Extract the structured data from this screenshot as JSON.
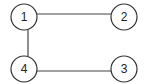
{
  "diagram": {
    "type": "graph",
    "nodes": [
      {
        "id": "1",
        "label": "1",
        "cx": 24,
        "cy": 17,
        "r": 13
      },
      {
        "id": "2",
        "label": "2",
        "cx": 124,
        "cy": 17,
        "r": 13
      },
      {
        "id": "3",
        "label": "3",
        "cx": 124,
        "cy": 69,
        "r": 13
      },
      {
        "id": "4",
        "label": "4",
        "cx": 24,
        "cy": 69,
        "r": 13
      }
    ],
    "edges": [
      {
        "from": "1",
        "to": "2"
      },
      {
        "from": "1",
        "to": "4"
      },
      {
        "from": "4",
        "to": "3"
      }
    ]
  }
}
